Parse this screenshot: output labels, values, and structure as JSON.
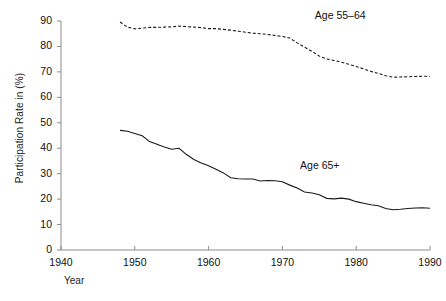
{
  "chart_data": {
    "type": "line",
    "title": "",
    "xlabel": "Year",
    "ylabel": "Participation Rate in (%)",
    "xlim": [
      1940,
      1990
    ],
    "ylim": [
      0,
      90
    ],
    "xticks": [
      1940,
      1950,
      1960,
      1970,
      1980,
      1990
    ],
    "yticks": [
      0,
      10,
      20,
      30,
      40,
      50,
      60,
      70,
      80,
      90
    ],
    "grid": false,
    "legend_position": "inline-annotations",
    "series": [
      {
        "name": "Age 55–64",
        "style": "dashed",
        "color": "#1a1a1a",
        "label_x": 1979,
        "label_y": 92,
        "x": [
          1948,
          1949,
          1950,
          1951,
          1952,
          1953,
          1954,
          1955,
          1956,
          1957,
          1958,
          1959,
          1960,
          1961,
          1962,
          1963,
          1964,
          1965,
          1966,
          1967,
          1968,
          1969,
          1970,
          1971,
          1972,
          1973,
          1974,
          1975,
          1976,
          1977,
          1978,
          1979,
          1980,
          1981,
          1982,
          1983,
          1984,
          1985,
          1986,
          1987,
          1988,
          1989,
          1990
        ],
        "values": [
          89.6,
          87.6,
          86.9,
          87.2,
          87.5,
          87.5,
          87.6,
          87.7,
          88.0,
          87.8,
          87.6,
          87.4,
          87.0,
          87.0,
          86.7,
          86.4,
          86.0,
          85.6,
          85.2,
          85.0,
          84.7,
          84.3,
          83.9,
          83.3,
          81.4,
          79.7,
          78.1,
          76.2,
          75.1,
          74.5,
          73.8,
          73.0,
          72.1,
          71.2,
          70.2,
          69.4,
          68.5,
          67.9,
          68.0,
          68.1,
          68.2,
          68.3,
          68.3
        ]
      },
      {
        "name": "Age 65+",
        "style": "solid",
        "color": "#1a1a1a",
        "label_x": 1977,
        "label_y": 33,
        "x": [
          1948,
          1949,
          1950,
          1951,
          1952,
          1953,
          1954,
          1955,
          1956,
          1957,
          1958,
          1959,
          1960,
          1961,
          1962,
          1963,
          1964,
          1965,
          1966,
          1967,
          1968,
          1969,
          1970,
          1971,
          1972,
          1973,
          1974,
          1975,
          1976,
          1977,
          1978,
          1979,
          1980,
          1981,
          1982,
          1983,
          1984,
          1985,
          1986,
          1987,
          1988,
          1989,
          1990
        ],
        "values": [
          47.0,
          46.7,
          45.8,
          44.9,
          42.6,
          41.6,
          40.5,
          39.6,
          40.0,
          37.5,
          35.6,
          34.2,
          33.1,
          31.7,
          30.3,
          28.4,
          28.0,
          27.9,
          27.9,
          27.1,
          27.3,
          27.2,
          26.8,
          25.5,
          24.4,
          22.8,
          22.4,
          21.7,
          20.3,
          20.1,
          20.4,
          20.0,
          19.0,
          18.4,
          17.8,
          17.4,
          16.3,
          15.8,
          16.0,
          16.3,
          16.5,
          16.6,
          16.4
        ]
      }
    ]
  },
  "labels": {
    "xaxis": "Year",
    "yaxis": "Participation Rate in (%)",
    "series_55_64": "Age 55–64",
    "series_65_plus": "Age 65+"
  },
  "ticks": {
    "x": [
      "1940",
      "1950",
      "1960",
      "1970",
      "1980",
      "1990"
    ],
    "y": [
      "90",
      "80",
      "70",
      "60",
      "50",
      "40",
      "30",
      "20",
      "10",
      "0"
    ]
  },
  "colors": {
    "ink": "#1a1a1a",
    "axis": "#888888",
    "background": "#ffffff"
  }
}
